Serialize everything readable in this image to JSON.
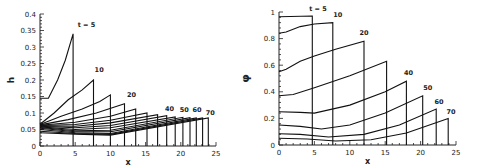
{
  "chart_data": [
    {
      "type": "line",
      "title": "",
      "xlabel": "x",
      "ylabel": "h",
      "xlim": [
        0,
        25
      ],
      "ylim": [
        0,
        0.4
      ],
      "xticks": [
        "0",
        "5",
        "10",
        "15",
        "20",
        "25"
      ],
      "yticks": [
        "0",
        "0.05",
        "0.1",
        "0.15",
        "0.2",
        "0.25",
        "0.3",
        "0.35",
        "0.4"
      ],
      "grid": false,
      "annotations": [
        "t = 5",
        "10",
        "20",
        "40",
        "50",
        "60",
        "70"
      ],
      "series": [
        {
          "name": "t=5",
          "front": 4.7,
          "x": [
            0,
            1.2,
            2.5,
            3.6,
            4.7
          ],
          "y": [
            0.145,
            0.145,
            0.2,
            0.26,
            0.34
          ]
        },
        {
          "name": "t=10",
          "front": 7.6,
          "x": [
            0,
            2,
            4,
            6,
            7.6
          ],
          "y": [
            0.066,
            0.1,
            0.14,
            0.17,
            0.2
          ]
        },
        {
          "name": "t=15",
          "front": 10.0,
          "x": [
            0,
            3,
            6,
            8.5,
            10
          ],
          "y": [
            0.065,
            0.09,
            0.112,
            0.135,
            0.155
          ]
        },
        {
          "name": "t=20",
          "front": 12.0,
          "x": [
            0,
            4,
            8,
            12
          ],
          "y": [
            0.064,
            0.08,
            0.1,
            0.128
          ]
        },
        {
          "name": "t=25",
          "front": 13.6,
          "x": [
            0,
            5,
            10,
            13.6
          ],
          "y": [
            0.063,
            0.072,
            0.09,
            0.112
          ]
        },
        {
          "name": "t=30",
          "front": 15.2,
          "x": [
            0,
            5,
            10,
            15.2
          ],
          "y": [
            0.062,
            0.065,
            0.078,
            0.1
          ]
        },
        {
          "name": "t=35",
          "front": 16.7,
          "x": [
            0,
            5,
            10,
            16.7
          ],
          "y": [
            0.061,
            0.06,
            0.07,
            0.095
          ]
        },
        {
          "name": "t=40",
          "front": 18.0,
          "x": [
            0,
            5,
            10,
            18
          ],
          "y": [
            0.06,
            0.055,
            0.062,
            0.092
          ]
        },
        {
          "name": "t=45",
          "front": 19.2,
          "x": [
            0,
            5,
            10,
            19.2
          ],
          "y": [
            0.058,
            0.05,
            0.055,
            0.088
          ]
        },
        {
          "name": "t=50",
          "front": 20.3,
          "x": [
            0,
            5,
            10,
            20.3
          ],
          "y": [
            0.056,
            0.046,
            0.048,
            0.087
          ]
        },
        {
          "name": "t=55",
          "front": 21.3,
          "x": [
            0,
            5,
            10,
            21.3
          ],
          "y": [
            0.054,
            0.043,
            0.043,
            0.086
          ]
        },
        {
          "name": "t=60",
          "front": 22.2,
          "x": [
            0,
            5,
            10,
            22.2
          ],
          "y": [
            0.05,
            0.04,
            0.038,
            0.085
          ]
        },
        {
          "name": "t=65",
          "front": 23.1,
          "x": [
            0,
            5,
            10,
            23.1
          ],
          "y": [
            0.045,
            0.038,
            0.035,
            0.085
          ]
        },
        {
          "name": "t=70",
          "front": 23.9,
          "x": [
            0,
            5,
            10,
            23.9
          ],
          "y": [
            0.04,
            0.036,
            0.033,
            0.085
          ]
        }
      ],
      "labels": [
        {
          "text": "t = 5",
          "x": 6.6,
          "y": 0.36
        },
        {
          "text": "10",
          "x": 8.4,
          "y": 0.225
        },
        {
          "text": "20",
          "x": 13.0,
          "y": 0.147
        },
        {
          "text": "40",
          "x": 18.4,
          "y": 0.107
        },
        {
          "text": "50",
          "x": 20.5,
          "y": 0.102
        },
        {
          "text": "60",
          "x": 22.3,
          "y": 0.102
        },
        {
          "text": "70",
          "x": 24.2,
          "y": 0.095
        }
      ]
    },
    {
      "type": "line",
      "title": "",
      "xlabel": "x",
      "ylabel": "φ",
      "xlim": [
        0,
        25
      ],
      "ylim": [
        0,
        1
      ],
      "xticks": [
        "0",
        "5",
        "10",
        "15",
        "20",
        "25"
      ],
      "yticks": [
        "0",
        "0.2",
        "0.4",
        "0.6",
        "0.8",
        "1"
      ],
      "grid": false,
      "annotations": [
        "t = 5",
        "10",
        "20",
        "40",
        "50",
        "60",
        "70"
      ],
      "series": [
        {
          "name": "t=5",
          "front": 4.7,
          "x": [
            0,
            4.7
          ],
          "y": [
            0.965,
            0.97
          ]
        },
        {
          "name": "t=10",
          "front": 7.6,
          "x": [
            0,
            1,
            3,
            5,
            7.6
          ],
          "y": [
            0.84,
            0.85,
            0.89,
            0.91,
            0.92
          ]
        },
        {
          "name": "t=20",
          "front": 12.0,
          "x": [
            0,
            1,
            3,
            5,
            8,
            12
          ],
          "y": [
            0.55,
            0.57,
            0.63,
            0.67,
            0.72,
            0.78
          ]
        },
        {
          "name": "t=30",
          "front": 15.2,
          "x": [
            0,
            2,
            5,
            10,
            15.2
          ],
          "y": [
            0.37,
            0.38,
            0.43,
            0.52,
            0.63
          ]
        },
        {
          "name": "t=40",
          "front": 18.0,
          "x": [
            0,
            3,
            5,
            10,
            15,
            18
          ],
          "y": [
            0.25,
            0.245,
            0.24,
            0.3,
            0.4,
            0.48
          ]
        },
        {
          "name": "t=50",
          "front": 20.3,
          "x": [
            0,
            3,
            6,
            10,
            15,
            20.3
          ],
          "y": [
            0.15,
            0.14,
            0.12,
            0.15,
            0.24,
            0.37
          ]
        },
        {
          "name": "t=60",
          "front": 22.2,
          "x": [
            0,
            3,
            7,
            12,
            17,
            22.2
          ],
          "y": [
            0.085,
            0.08,
            0.06,
            0.08,
            0.15,
            0.27
          ]
        },
        {
          "name": "t=70",
          "front": 23.9,
          "x": [
            0,
            4,
            8,
            13,
            18,
            23.9
          ],
          "y": [
            0.05,
            0.045,
            0.03,
            0.04,
            0.09,
            0.2
          ]
        }
      ],
      "labels": [
        {
          "text": "t = 5",
          "x": 5.5,
          "y": 1.01
        },
        {
          "text": "10",
          "x": 8.3,
          "y": 0.96
        },
        {
          "text": "20",
          "x": 12.0,
          "y": 0.83
        },
        {
          "text": "40",
          "x": 18.3,
          "y": 0.53
        },
        {
          "text": "50",
          "x": 21.0,
          "y": 0.41
        },
        {
          "text": "60",
          "x": 22.6,
          "y": 0.31
        },
        {
          "text": "70",
          "x": 24.3,
          "y": 0.23
        }
      ]
    }
  ]
}
